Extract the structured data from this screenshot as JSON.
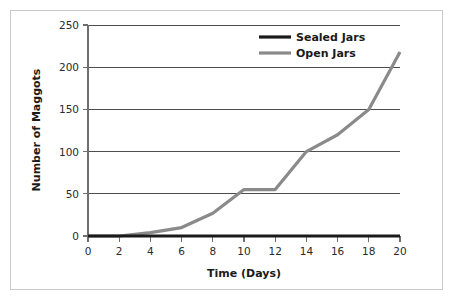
{
  "chart_data": {
    "type": "line",
    "title": "",
    "xlabel": "Time (Days)",
    "ylabel": "Number of Maggots",
    "xlim": [
      0,
      20
    ],
    "ylim": [
      0,
      250
    ],
    "xticks": [
      0,
      2,
      4,
      6,
      8,
      10,
      12,
      14,
      16,
      18,
      20
    ],
    "yticks": [
      0,
      50,
      100,
      150,
      200,
      250
    ],
    "grid": "horizontal",
    "legend_position": "top-right",
    "x": [
      0,
      2,
      4,
      6,
      8,
      10,
      12,
      14,
      16,
      18,
      20
    ],
    "series": [
      {
        "name": "Sealed Jars",
        "color": "#1a1a1a",
        "values": [
          0,
          0,
          0,
          0,
          0,
          0,
          0,
          0,
          0,
          0,
          0
        ]
      },
      {
        "name": "Open Jars",
        "color": "#8a8a8a",
        "values": [
          0,
          0,
          4,
          10,
          27,
          55,
          55,
          100,
          120,
          150,
          218
        ]
      }
    ]
  },
  "axes": {
    "x_title": "Time (Days)",
    "y_title": "Number of Maggots",
    "x_tick_labels": [
      "0",
      "2",
      "4",
      "6",
      "8",
      "10",
      "12",
      "14",
      "16",
      "18",
      "20"
    ],
    "y_tick_labels": [
      "0",
      "50",
      "100",
      "150",
      "200",
      "250"
    ]
  },
  "legend": {
    "entries": [
      {
        "label": "Sealed Jars",
        "color": "#1a1a1a"
      },
      {
        "label": "Open Jars",
        "color": "#8a8a8a"
      }
    ]
  },
  "colors": {
    "sealed_jars": "#1a1a1a",
    "open_jars": "#8a8a8a",
    "gridline": "#4d4d4d",
    "axis": "#6e6e6e",
    "frame": "#c9c9c9",
    "background": "#ffffff"
  }
}
